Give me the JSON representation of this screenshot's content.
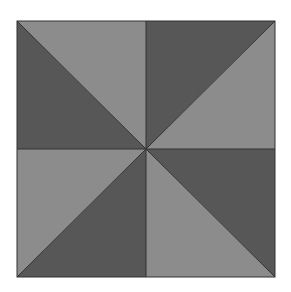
{
  "figure": {
    "colors": {
      "background": "#ffffff",
      "light": "#8c8c8c",
      "dark": "#575757",
      "stroke": "#333333"
    },
    "square": {
      "x": 17,
      "y": 21,
      "width": 258,
      "height": 256
    },
    "center": {
      "x": 146,
      "y": 149
    },
    "triangles": [
      {
        "name": "top-left-upper",
        "shade": "light"
      },
      {
        "name": "top-left-lower",
        "shade": "dark"
      },
      {
        "name": "top-right-upper",
        "shade": "dark"
      },
      {
        "name": "top-right-lower",
        "shade": "light"
      },
      {
        "name": "bottom-left-upper",
        "shade": "light"
      },
      {
        "name": "bottom-left-lower",
        "shade": "dark"
      },
      {
        "name": "bottom-right-upper",
        "shade": "dark"
      },
      {
        "name": "bottom-right-lower",
        "shade": "light"
      }
    ]
  }
}
